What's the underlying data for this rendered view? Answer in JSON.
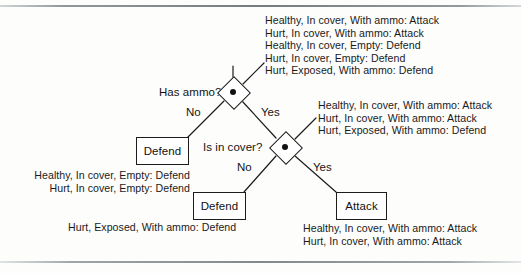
{
  "figure": {
    "nodes": [
      {
        "id": "has-ammo",
        "label": "Has ammo?",
        "type": "decision",
        "x": 233,
        "y": 92
      },
      {
        "id": "is-in-cover",
        "label": "Is in cover?",
        "type": "decision",
        "x": 285,
        "y": 147
      }
    ],
    "leaves": [
      {
        "id": "defend-no-ammo",
        "label": "Defend",
        "x": 136,
        "y": 137,
        "w": 51,
        "h": 26
      },
      {
        "id": "defend-no-cover",
        "label": "Defend",
        "x": 193,
        "y": 192,
        "w": 51,
        "h": 26
      },
      {
        "id": "attack-in-cover",
        "label": "Attack",
        "x": 336,
        "y": 192,
        "w": 49,
        "h": 26
      }
    ],
    "branch_labels": {
      "has_ammo_no": "No",
      "has_ammo_yes": "Yes",
      "is_in_cover_no": "No",
      "is_in_cover_yes": "Yes"
    },
    "annotations": {
      "root_examples": [
        "Healthy, In cover, With ammo: Attack",
        "Hurt, In cover, With ammo: Attack",
        "Healthy, In cover, Empty: Defend",
        "Hurt, In cover, Empty: Defend",
        "Hurt, Exposed, With ammo: Defend"
      ],
      "cover_examples": [
        "Healthy, In cover, With ammo: Attack",
        "Hurt, In cover, With ammo: Attack",
        "Hurt, Exposed, With ammo: Defend"
      ],
      "defend_no_ammo_examples": [
        "Healthy, In cover, Empty: Defend",
        "Hurt, In cover, Empty: Defend"
      ],
      "defend_no_cover_examples": [
        "Hurt, Exposed, With ammo: Defend"
      ],
      "attack_examples": [
        "Healthy, In cover, With ammo: Attack",
        "Hurt, In cover, With ammo: Attack"
      ]
    },
    "colors": {
      "ink": "#1c1c1c",
      "paper": "#fdfdfc",
      "rule": "#7d8285"
    }
  }
}
